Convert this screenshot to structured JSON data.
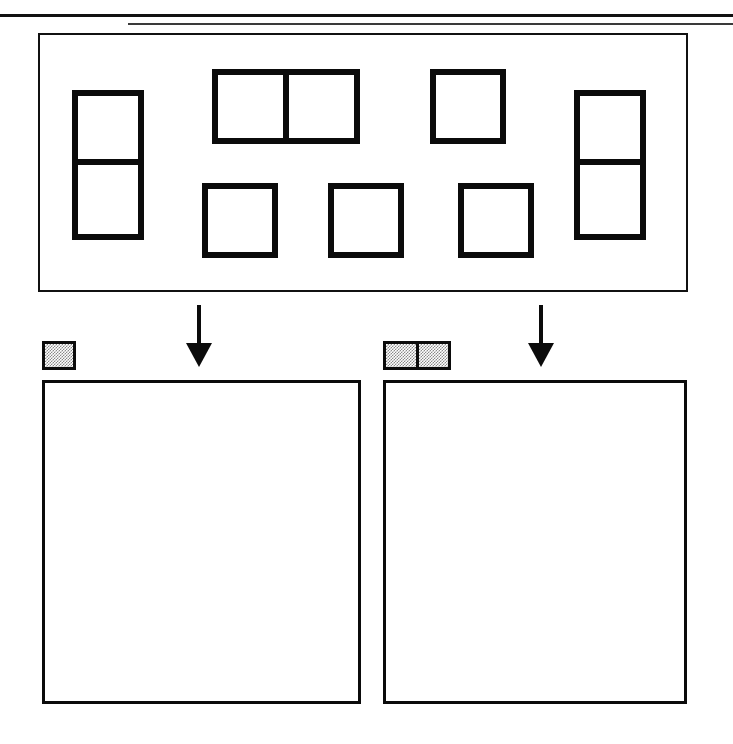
{
  "figure": {
    "caption_clipped": "",
    "background_color": "#ffffff",
    "line_color": "#0b0b0b",
    "swatch_fill_color": "#8a8a8a"
  },
  "rules": {
    "top_rule_name": "top-horizontal-rule",
    "bottom_rule_name": "secondary-horizontal-rule"
  },
  "pool": {
    "label": "",
    "border_color": "#111111",
    "shapes": [
      {
        "name": "vertical-domino-left",
        "kind": "domino",
        "orientation": "vertical",
        "cells": 2,
        "x": 32,
        "y": 55,
        "w": 72,
        "h": 150
      },
      {
        "name": "horizontal-domino-top",
        "kind": "domino",
        "orientation": "horizontal",
        "cells": 2,
        "x": 172,
        "y": 34,
        "w": 148,
        "h": 75
      },
      {
        "name": "single-square-top",
        "kind": "monomino",
        "orientation": "none",
        "cells": 1,
        "x": 390,
        "y": 34,
        "w": 76,
        "h": 75
      },
      {
        "name": "vertical-domino-right",
        "kind": "domino",
        "orientation": "vertical",
        "cells": 2,
        "x": 534,
        "y": 55,
        "w": 72,
        "h": 150
      },
      {
        "name": "single-square-row2-a",
        "kind": "monomino",
        "orientation": "none",
        "cells": 1,
        "x": 162,
        "y": 148,
        "w": 76,
        "h": 75
      },
      {
        "name": "single-square-row2-b",
        "kind": "monomino",
        "orientation": "none",
        "cells": 1,
        "x": 288,
        "y": 148,
        "w": 76,
        "h": 75
      },
      {
        "name": "single-square-row2-c",
        "kind": "monomino",
        "orientation": "none",
        "cells": 1,
        "x": 418,
        "y": 148,
        "w": 76,
        "h": 75
      }
    ]
  },
  "arrows": [
    {
      "name": "arrow-to-left-box",
      "direction": "down",
      "x": 186,
      "y": 305
    },
    {
      "name": "arrow-to-right-box",
      "direction": "down",
      "x": 528,
      "y": 305
    }
  ],
  "sorting": {
    "groups": [
      {
        "name": "group-monomino",
        "swatch": {
          "name": "swatch-single-square",
          "cells": 1,
          "orientation": "none",
          "x": 42,
          "y": 341,
          "w": 34,
          "h": 29
        },
        "dropbox": {
          "name": "dropbox-monomino",
          "x": 42,
          "y": 380,
          "w": 319,
          "h": 324,
          "contents": []
        }
      },
      {
        "name": "group-domino",
        "swatch": {
          "name": "swatch-double-square",
          "cells": 2,
          "orientation": "horizontal",
          "x": 383,
          "y": 341,
          "w": 68,
          "h": 29
        },
        "dropbox": {
          "name": "dropbox-domino",
          "x": 383,
          "y": 380,
          "w": 304,
          "h": 324,
          "contents": []
        }
      }
    ]
  }
}
